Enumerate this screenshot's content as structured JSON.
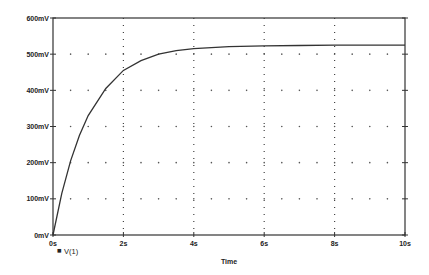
{
  "chart_data": {
    "type": "line",
    "title": "",
    "xlabel": "Time",
    "ylabel": "",
    "xlim": [
      0,
      10
    ],
    "ylim": [
      0,
      600
    ],
    "x_unit": "s",
    "y_unit": "mV",
    "x_ticks": [
      "0s",
      "2s",
      "4s",
      "6s",
      "8s",
      "10s"
    ],
    "y_ticks": [
      "0mV",
      "100mV",
      "200mV",
      "300mV",
      "400mV",
      "500mV",
      "600mV"
    ],
    "grid": "dotted",
    "legend": [
      {
        "marker": "square",
        "label": "V(1)"
      }
    ],
    "legend_position": "bottom-left",
    "series": [
      {
        "name": "V(1)",
        "x": [
          0,
          0.25,
          0.5,
          0.75,
          1,
          1.5,
          2,
          2.5,
          3,
          3.5,
          4,
          5,
          6,
          7,
          8,
          9,
          10
        ],
        "values": [
          0,
          115,
          205,
          275,
          330,
          405,
          455,
          482,
          500,
          510,
          515,
          521,
          523,
          524,
          525,
          525,
          525
        ]
      }
    ]
  },
  "plot": {
    "legend_marker": "■",
    "legend_label": "V(1)",
    "x_axis_title": "Time"
  }
}
